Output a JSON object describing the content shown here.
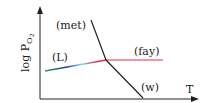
{
  "diagram": {
    "type": "phase-stability-sketch",
    "axes": {
      "x_label": "T",
      "y_label": "log P",
      "y_label_sub": "O",
      "y_label_subsub": "2"
    },
    "curves": [
      {
        "id": "met",
        "label": "(met)",
        "color": "#1a1a1a"
      },
      {
        "id": "fay",
        "label": "(fay)",
        "color": "#e0304a"
      },
      {
        "id": "L",
        "label": "(L)",
        "colors": [
          "#3a9a3a",
          "#2a3aa0",
          "#7fd8e8",
          "#e0304a"
        ]
      },
      {
        "id": "w",
        "label": "(w)",
        "color": "#1a1a1a"
      }
    ]
  }
}
